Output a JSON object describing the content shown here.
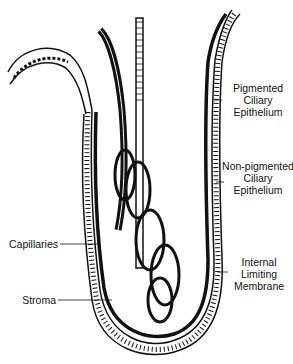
{
  "figure": {
    "labels": {
      "pigmented": [
        "Pigmented",
        "Ciliary",
        "Epithelium"
      ],
      "nonpigmented": [
        "Non-pigmented",
        "Ciliary",
        "Epithelium"
      ],
      "capillaries": "Capillaries",
      "stroma": "Stroma",
      "ilm": [
        "Internal",
        "Limiting",
        "Membrane"
      ]
    }
  }
}
